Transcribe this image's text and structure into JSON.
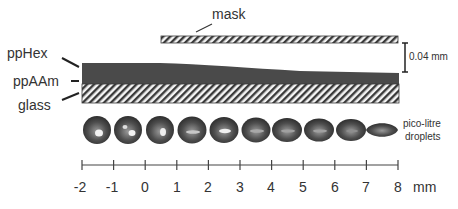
{
  "labels": {
    "mask": "mask",
    "pphex": "ppHex",
    "ppaam": "ppAAm",
    "glass": "glass",
    "scale_bar": "0.04 mm",
    "droplets_line1": "pico-litre",
    "droplets_line2": "droplets",
    "axis_unit": "mm"
  },
  "axis": {
    "ticks": [
      "-2",
      "-1",
      "0",
      "1",
      "2",
      "3",
      "4",
      "5",
      "6",
      "7",
      "8"
    ],
    "unit": "mm",
    "range": [
      -2,
      8
    ]
  },
  "layers": [
    {
      "name": "mask",
      "fill": "hatched"
    },
    {
      "name": "ppHex",
      "fill": "dark-gradient-taper"
    },
    {
      "name": "ppAAm",
      "fill": "dark"
    },
    {
      "name": "glass",
      "fill": "hatched"
    }
  ],
  "droplets": {
    "count": 10,
    "shape_progression": "round to flattened"
  },
  "colors": {
    "layer_dark": "#4a4a4a",
    "hatch": "#3a3a3a",
    "text": "#333333",
    "background": "#ffffff"
  }
}
